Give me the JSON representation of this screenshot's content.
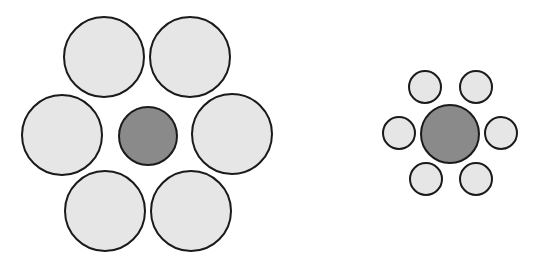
{
  "figure": {
    "colors": {
      "background": "#ffffff",
      "surround_fill": "#e6e6e6",
      "center_fill": "#8a8a8a",
      "stroke": "#1a1a1a"
    },
    "groups": [
      {
        "name": "large-surround-group",
        "center": {
          "cx": 148,
          "cy": 136,
          "r": 29
        },
        "surround": [
          {
            "cx": 104,
            "cy": 57,
            "r": 40
          },
          {
            "cx": 190,
            "cy": 57,
            "r": 40
          },
          {
            "cx": 62,
            "cy": 135,
            "r": 40
          },
          {
            "cx": 232,
            "cy": 134,
            "r": 40
          },
          {
            "cx": 105,
            "cy": 211,
            "r": 40
          },
          {
            "cx": 191,
            "cy": 211,
            "r": 40
          }
        ]
      },
      {
        "name": "small-surround-group",
        "center": {
          "cx": 450,
          "cy": 134,
          "r": 29
        },
        "surround": [
          {
            "cx": 425,
            "cy": 87,
            "r": 16
          },
          {
            "cx": 476,
            "cy": 87,
            "r": 16
          },
          {
            "cx": 399,
            "cy": 133,
            "r": 16
          },
          {
            "cx": 501,
            "cy": 133,
            "r": 16
          },
          {
            "cx": 426,
            "cy": 179,
            "r": 16
          },
          {
            "cx": 476,
            "cy": 179,
            "r": 16
          }
        ]
      }
    ]
  }
}
